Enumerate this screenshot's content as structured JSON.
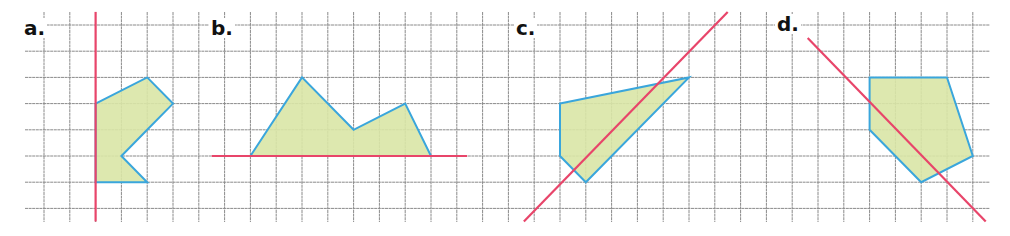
{
  "grid": {
    "origin_x": 44,
    "origin_y": 25,
    "step_x": 25.8,
    "step_y": 26.2,
    "cols": 37,
    "rows": 8,
    "line_color": "#8a8a8a",
    "vline_y_range": [
      12,
      222
    ],
    "hline_x_range": [
      25,
      990
    ]
  },
  "colors": {
    "fill": "#d9e6a6",
    "outline": "#3aa6dc",
    "mirror_line": "#e8456a",
    "label": "#111111"
  },
  "panels": [
    {
      "id": "a",
      "label": "a.",
      "label_pos": [
        22,
        18
      ],
      "mirror_line": {
        "type": "vertical",
        "from": [
          2,
          -0.5
        ],
        "to": [
          2,
          7.5
        ]
      },
      "polygon": [
        [
          2,
          3
        ],
        [
          4,
          2
        ],
        [
          5,
          3
        ],
        [
          4,
          4
        ],
        [
          3,
          5
        ],
        [
          4,
          6
        ],
        [
          2,
          6
        ]
      ]
    },
    {
      "id": "b",
      "label": "b.",
      "label_pos": [
        209,
        18
      ],
      "mirror_line": {
        "type": "horizontal",
        "from": [
          6.5,
          5
        ],
        "to": [
          16.4,
          5
        ]
      },
      "polygon": [
        [
          8,
          5
        ],
        [
          10,
          2
        ],
        [
          12,
          4
        ],
        [
          14,
          3
        ],
        [
          15,
          5
        ]
      ]
    },
    {
      "id": "c",
      "label": "c.",
      "label_pos": [
        514,
        18
      ],
      "mirror_line": {
        "type": "diagonal",
        "from": [
          18.6,
          7.5
        ],
        "to": [
          26.5,
          -0.5
        ]
      },
      "polygon": [
        [
          20,
          3
        ],
        [
          25,
          2
        ],
        [
          21,
          6
        ],
        [
          20,
          5
        ]
      ]
    },
    {
      "id": "d",
      "label": "d.",
      "label_pos": [
        775,
        14
      ],
      "mirror_line": {
        "type": "diagonal",
        "from": [
          29.6,
          0.5
        ],
        "to": [
          36.5,
          7.5
        ]
      },
      "polygon": [
        [
          32,
          2
        ],
        [
          35,
          2
        ],
        [
          36,
          5
        ],
        [
          34,
          6
        ],
        [
          32,
          4
        ]
      ]
    }
  ]
}
